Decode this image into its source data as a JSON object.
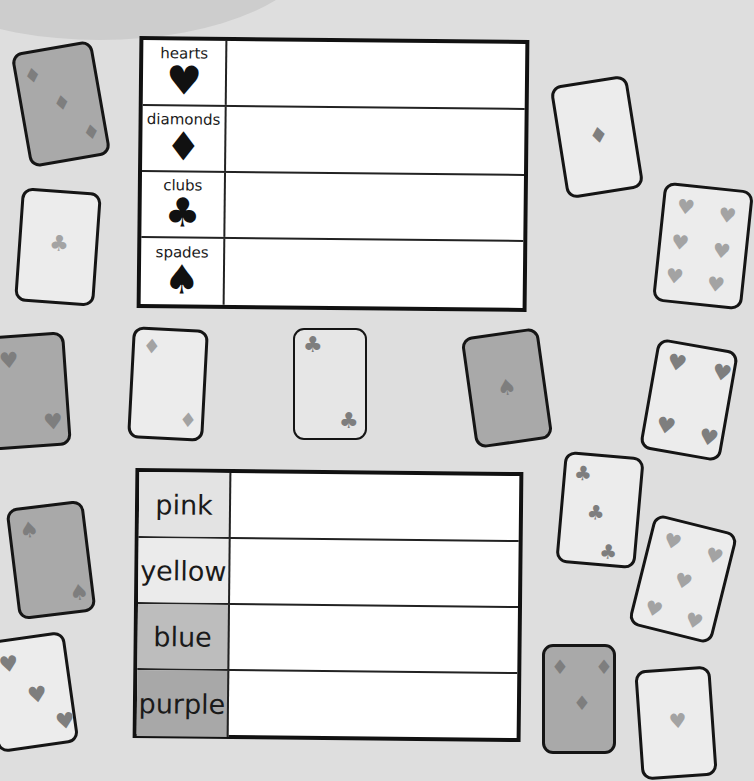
{
  "suit_table": {
    "rows": [
      {
        "label": "hearts",
        "symbol": "♥",
        "value": ""
      },
      {
        "label": "diamonds",
        "symbol": "♦",
        "value": ""
      },
      {
        "label": "clubs",
        "symbol": "♣",
        "value": ""
      },
      {
        "label": "spades",
        "symbol": "♠",
        "value": ""
      }
    ]
  },
  "color_table": {
    "rows": [
      {
        "label": "pink",
        "shade": "#e3e3e3",
        "value": ""
      },
      {
        "label": "yellow",
        "shade": "#ebebeb",
        "value": ""
      },
      {
        "label": "blue",
        "shade": "#bdbdbd",
        "value": ""
      },
      {
        "label": "purple",
        "shade": "#a8a8a8",
        "value": ""
      }
    ]
  },
  "cards": [
    {
      "suit": "diamond",
      "glyph": "♦",
      "count": 3,
      "shade": "dark"
    },
    {
      "suit": "club",
      "glyph": "♣",
      "count": 1,
      "shade": "light"
    },
    {
      "suit": "heart",
      "glyph": "♥",
      "count": 2,
      "shade": "dark"
    },
    {
      "suit": "diamond",
      "glyph": "♦",
      "count": 2,
      "shade": "light"
    },
    {
      "suit": "club",
      "glyph": "♣",
      "count": 2,
      "shade": "light"
    },
    {
      "suit": "spade",
      "glyph": "♠",
      "count": 1,
      "shade": "dark"
    },
    {
      "suit": "diamond",
      "glyph": "♦",
      "count": 1,
      "shade": "light"
    },
    {
      "suit": "heart",
      "glyph": "♥",
      "count": 6,
      "shade": "light"
    },
    {
      "suit": "heart",
      "glyph": "♥",
      "count": 4,
      "shade": "light"
    },
    {
      "suit": "club",
      "glyph": "♣",
      "count": 3,
      "shade": "light"
    },
    {
      "suit": "heart",
      "glyph": "♥",
      "count": 5,
      "shade": "light"
    },
    {
      "suit": "spade",
      "glyph": "♠",
      "count": 2,
      "shade": "dark"
    },
    {
      "suit": "heart",
      "glyph": "♥",
      "count": 3,
      "shade": "light"
    },
    {
      "suit": "diamond",
      "glyph": "♦",
      "count": 3,
      "shade": "dark"
    },
    {
      "suit": "heart",
      "glyph": "♥",
      "count": 2,
      "shade": "light"
    }
  ]
}
